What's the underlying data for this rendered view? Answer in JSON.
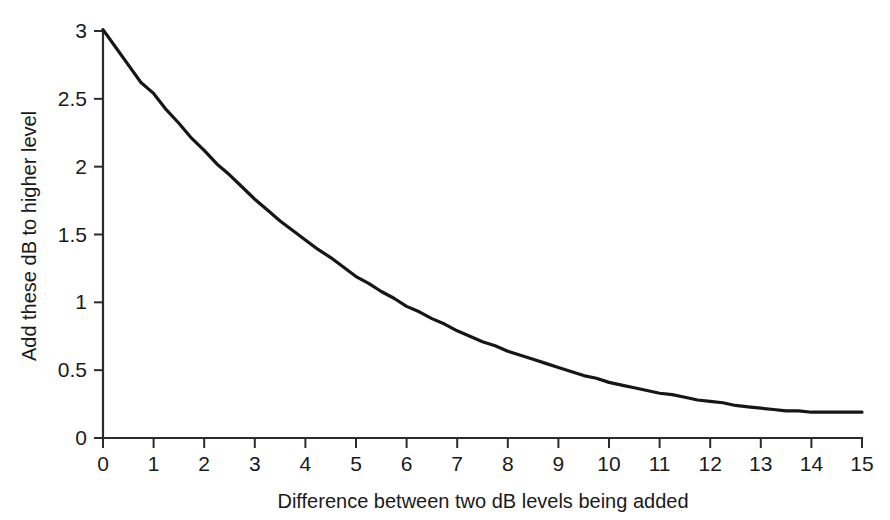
{
  "chart_data": {
    "type": "line",
    "title": "",
    "subtitle": "",
    "xlabel": "Difference between two dB levels being added",
    "ylabel": "Add these dB to higher level",
    "xlim": [
      0,
      15
    ],
    "ylim": [
      0,
      3
    ],
    "grid": false,
    "legend": "none",
    "x_ticks": [
      "0",
      "1",
      "2",
      "3",
      "4",
      "5",
      "6",
      "7",
      "8",
      "9",
      "10",
      "11",
      "12",
      "13",
      "14",
      "15"
    ],
    "y_ticks": [
      "0",
      "0.5",
      "1",
      "1.5",
      "2",
      "2.5",
      "3"
    ],
    "x_tick_values": [
      0,
      1,
      2,
      3,
      4,
      5,
      6,
      7,
      8,
      9,
      10,
      11,
      12,
      13,
      14,
      15
    ],
    "y_tick_values": [
      0,
      0.5,
      1,
      1.5,
      2,
      2.5,
      3
    ],
    "series": [
      {
        "name": "Level addition correction",
        "color": "#161616",
        "x": [
          0,
          0.25,
          0.5,
          0.75,
          1,
          1.25,
          1.5,
          1.75,
          2,
          2.25,
          2.5,
          2.75,
          3,
          3.25,
          3.5,
          3.75,
          4,
          4.25,
          4.5,
          4.75,
          5,
          5.25,
          5.5,
          5.75,
          6,
          6.25,
          6.5,
          6.75,
          7,
          7.25,
          7.5,
          7.75,
          8,
          8.25,
          8.5,
          8.75,
          9,
          9.25,
          9.5,
          9.75,
          10,
          10.25,
          10.5,
          10.75,
          11,
          11.25,
          11.5,
          11.75,
          12,
          12.25,
          12.5,
          12.75,
          13,
          13.25,
          13.5,
          13.75,
          14,
          14.25,
          14.5,
          14.75,
          15
        ],
        "y": [
          3.01,
          2.88,
          2.75,
          2.62,
          2.54,
          2.42,
          2.32,
          2.21,
          2.12,
          2.02,
          1.94,
          1.85,
          1.76,
          1.68,
          1.6,
          1.53,
          1.46,
          1.39,
          1.33,
          1.26,
          1.19,
          1.14,
          1.08,
          1.03,
          0.97,
          0.93,
          0.88,
          0.84,
          0.79,
          0.75,
          0.71,
          0.68,
          0.64,
          0.61,
          0.58,
          0.55,
          0.52,
          0.49,
          0.46,
          0.44,
          0.41,
          0.39,
          0.37,
          0.35,
          0.33,
          0.32,
          0.3,
          0.28,
          0.27,
          0.26,
          0.24,
          0.23,
          0.22,
          0.21,
          0.2,
          0.2,
          0.19,
          0.19,
          0.19,
          0.19,
          0.19
        ]
      }
    ],
    "annotations": []
  },
  "axes": {
    "x_title": "Difference between two dB levels being added",
    "y_title": "Add these dB to higher level"
  }
}
